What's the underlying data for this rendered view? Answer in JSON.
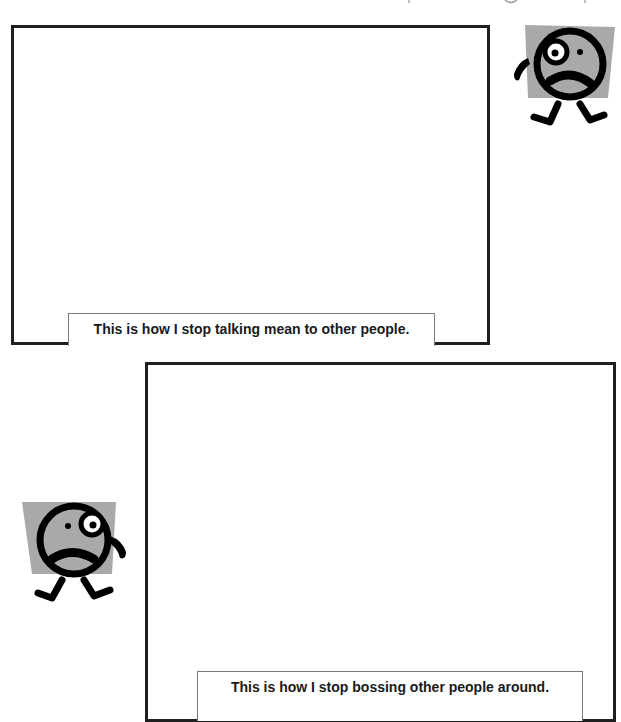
{
  "page": {
    "background": "#ffffff",
    "frame_border_color": "#1f1f1f",
    "caption_border_color": "#7a7a7a",
    "character_fill": "#a9a9a9",
    "character_line": "#000000"
  },
  "panels": [
    {
      "caption": "This is how I stop talking mean to other people.",
      "character": "sad-face-character-icon",
      "character_position": "top-right"
    },
    {
      "caption": "This is how I stop bossing other people around.",
      "character": "sad-face-character-icon",
      "character_position": "left"
    }
  ]
}
